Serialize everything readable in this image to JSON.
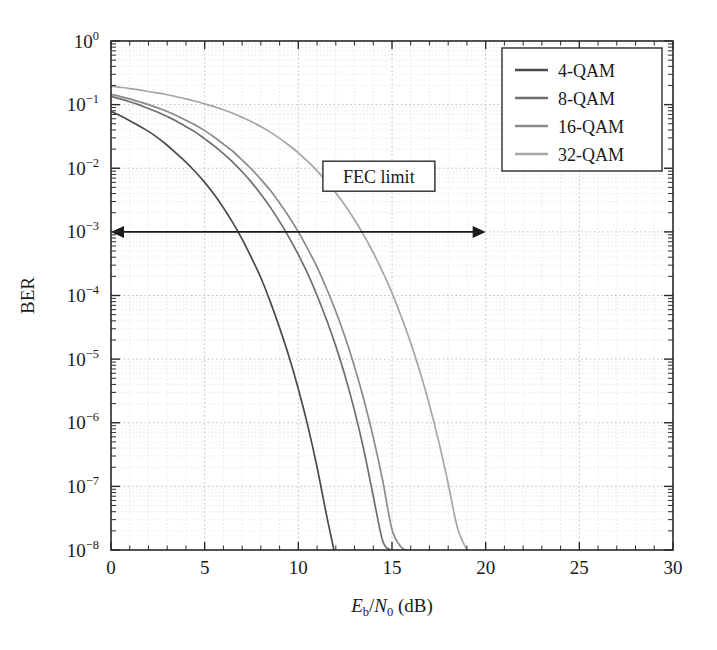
{
  "chart_data": {
    "type": "line",
    "title": "",
    "xlabel": "Eb/N0 (dB)",
    "xlabel_parts": {
      "e": "E",
      "e_sub": "b",
      "slash": "/",
      "n": "N",
      "n_sub": "0",
      "unit": "(dB)"
    },
    "ylabel": "BER",
    "xlim": [
      0,
      30
    ],
    "ylim": [
      1e-08,
      1
    ],
    "yscale": "log",
    "xscale": "linear",
    "grid": "both-major-and-minor-dotted",
    "legend_position": "top-right",
    "xticks": [
      0,
      5,
      10,
      15,
      20,
      25,
      30
    ],
    "xticklabels": [
      "0",
      "5",
      "10",
      "15",
      "20",
      "25",
      "30"
    ],
    "yticks": [
      1,
      0.1,
      0.01,
      0.001,
      0.0001,
      1e-05,
      1e-06,
      1e-07,
      1e-08
    ],
    "yticklabels": [
      {
        "mantissa": "10",
        "exponent": "0"
      },
      {
        "mantissa": "10",
        "exponent": "-1"
      },
      {
        "mantissa": "10",
        "exponent": "-2"
      },
      {
        "mantissa": "10",
        "exponent": "-3"
      },
      {
        "mantissa": "10",
        "exponent": "-4"
      },
      {
        "mantissa": "10",
        "exponent": "-5"
      },
      {
        "mantissa": "10",
        "exponent": "-6"
      },
      {
        "mantissa": "10",
        "exponent": "-7"
      },
      {
        "mantissa": "10",
        "exponent": "-8"
      }
    ],
    "series": [
      {
        "name": "4-QAM",
        "color": "#4a4a4a",
        "x": [
          0.0,
          0.5,
          1.0,
          1.5,
          2.0,
          2.5,
          3.0,
          3.5,
          4.0,
          4.5,
          5.0,
          5.5,
          6.0,
          6.5,
          7.0,
          7.5,
          8.0,
          8.5,
          9.0,
          9.5,
          10.0,
          10.5,
          11.0,
          11.5,
          11.9
        ],
        "y": [
          0.078,
          0.067,
          0.056,
          0.046,
          0.038,
          0.03,
          0.023,
          0.017,
          0.0125,
          0.0088,
          0.006,
          0.0039,
          0.0024,
          0.0014,
          0.00077,
          0.00039,
          0.00019,
          8e-05,
          3.1e-05,
          1.1e-05,
          3.4e-06,
          9.1e-07,
          2e-07,
          3.6e-08,
          1e-08
        ]
      },
      {
        "name": "8-QAM",
        "color": "#6e6e6e",
        "x": [
          0.0,
          0.5,
          1.0,
          1.5,
          2.0,
          2.5,
          3.0,
          3.5,
          4.0,
          4.5,
          5.0,
          5.5,
          6.0,
          6.5,
          7.0,
          7.5,
          8.0,
          8.5,
          9.0,
          9.5,
          10.0,
          10.5,
          11.0,
          11.5,
          12.0,
          12.5,
          13.0,
          13.5,
          14.0,
          14.5,
          14.9
        ],
        "y": [
          0.135,
          0.123,
          0.111,
          0.099,
          0.087,
          0.076,
          0.065,
          0.055,
          0.045,
          0.037,
          0.029,
          0.0225,
          0.017,
          0.0125,
          0.0088,
          0.006,
          0.0039,
          0.00245,
          0.00145,
          0.00082,
          0.00044,
          0.00022,
          0.0001,
          4.2e-05,
          1.6e-05,
          5.4e-06,
          1.55e-06,
          3.7e-07,
          7e-08,
          1.4e-08,
          1e-08
        ]
      },
      {
        "name": "16-QAM",
        "color": "#8a8a8a",
        "x": [
          0.0,
          0.5,
          1.0,
          1.5,
          2.0,
          2.5,
          3.0,
          3.5,
          4.0,
          4.5,
          5.0,
          5.5,
          6.0,
          6.5,
          7.0,
          7.5,
          8.0,
          8.5,
          9.0,
          9.5,
          10.0,
          10.5,
          11.0,
          11.5,
          12.0,
          12.5,
          13.0,
          13.5,
          14.0,
          14.5,
          15.0,
          15.5,
          15.8
        ],
        "y": [
          0.145,
          0.134,
          0.123,
          0.111,
          0.1,
          0.089,
          0.078,
          0.067,
          0.057,
          0.048,
          0.039,
          0.031,
          0.024,
          0.0185,
          0.0135,
          0.0097,
          0.0067,
          0.0045,
          0.00285,
          0.00173,
          0.001,
          0.00054,
          0.00028,
          0.00013,
          5.6e-05,
          2.2e-05,
          7.6e-06,
          2.3e-06,
          5.9e-07,
          1.25e-07,
          2.1e-08,
          1.1e-08,
          1e-08
        ]
      },
      {
        "name": "32-QAM",
        "color": "#a6a6a6",
        "x": [
          0.0,
          0.5,
          1.0,
          1.5,
          2.0,
          2.5,
          3.0,
          3.5,
          4.0,
          4.5,
          5.0,
          5.5,
          6.0,
          6.5,
          7.0,
          7.5,
          8.0,
          8.5,
          9.0,
          9.5,
          10.0,
          10.5,
          11.0,
          11.5,
          12.0,
          12.5,
          13.0,
          13.5,
          14.0,
          14.5,
          15.0,
          15.5,
          16.0,
          16.5,
          17.0,
          17.5,
          18.0,
          18.5,
          19.0
        ],
        "y": [
          0.195,
          0.187,
          0.179,
          0.17,
          0.161,
          0.152,
          0.143,
          0.133,
          0.123,
          0.113,
          0.103,
          0.093,
          0.083,
          0.073,
          0.063,
          0.054,
          0.045,
          0.037,
          0.0295,
          0.023,
          0.0175,
          0.0128,
          0.0091,
          0.0062,
          0.0041,
          0.0026,
          0.00155,
          0.00088,
          0.00047,
          0.000235,
          0.00011,
          4.6e-05,
          1.8e-05,
          6.2e-06,
          1.9e-06,
          5e-07,
          1.1e-07,
          2.2e-08,
          1e-08
        ]
      }
    ],
    "annotations": [
      {
        "label": "FEC limit",
        "type": "double-arrow-with-box",
        "y_value": 0.001,
        "x_start": 0,
        "x_end": 20,
        "box_x_center": 14.3,
        "box_y": 0.0075
      }
    ]
  },
  "legend": {
    "entries": [
      "4-QAM",
      "8-QAM",
      "16-QAM",
      "32-QAM"
    ]
  }
}
